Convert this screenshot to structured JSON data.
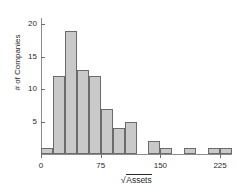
{
  "chart_data": {
    "type": "bar",
    "title": "",
    "subtitle": "",
    "xlabel": "√Assets",
    "ylabel": "# of Companies",
    "xlabel_parts": {
      "radical": "√",
      "radicand": "Assets"
    },
    "grid": false,
    "legend": null,
    "bin_width": 15,
    "bin_starts": [
      0,
      15,
      30,
      45,
      60,
      75,
      90,
      105,
      120,
      135,
      150,
      165,
      180,
      195,
      210,
      225
    ],
    "categories": [
      "0-15",
      "15-30",
      "30-45",
      "45-60",
      "60-75",
      "75-90",
      "90-105",
      "105-120",
      "120-135",
      "135-150",
      "150-165",
      "165-180",
      "180-195",
      "195-210",
      "210-225",
      "225-240"
    ],
    "values": [
      1,
      12,
      19,
      13,
      12,
      7,
      4,
      5,
      0,
      2,
      1,
      0,
      1,
      0,
      1,
      1
    ],
    "xlim": [
      0,
      240
    ],
    "ylim": [
      0,
      21
    ],
    "xticks": [
      0,
      75,
      150,
      225
    ],
    "xtick_labels": [
      "0",
      "75",
      "150",
      "225"
    ],
    "yticks": [
      5,
      10,
      15,
      20
    ],
    "ytick_labels": [
      "5",
      "10",
      "15",
      "20"
    ],
    "bar_fill_color": "#c9c9c9",
    "bar_edge_color": "#6b6b6b",
    "axis_color": "#8d8d8d",
    "text_color": "#2b2b2b",
    "background_color": "#ffffff"
  }
}
